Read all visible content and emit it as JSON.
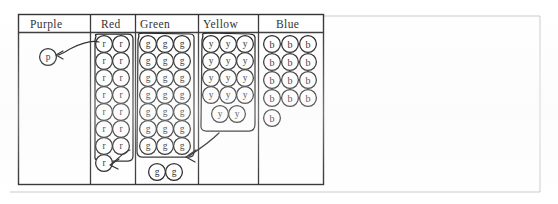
{
  "page": {
    "background_color": "#ffffff",
    "ink_color": "#111111",
    "rule_color": "#2b2b2b",
    "faint_rule_color": "#c9c9c9",
    "width": 558,
    "height": 204
  },
  "table": {
    "x": 18,
    "y": 14,
    "width": 305,
    "height": 170,
    "header_height": 18,
    "columns": [
      {
        "key": "purple",
        "label": "Purple",
        "x": 18,
        "width": 72,
        "label_x": 30,
        "label_y": 19
      },
      {
        "key": "red",
        "label": "Red",
        "x": 90,
        "width": 45,
        "label_x": 101,
        "label_y": 19
      },
      {
        "key": "green",
        "label": "Green",
        "x": 135,
        "width": 63,
        "label_x": 140,
        "label_y": 19
      },
      {
        "key": "yellow",
        "label": "Yellow",
        "x": 198,
        "width": 60,
        "label_x": 203,
        "label_y": 19
      },
      {
        "key": "blue",
        "label": "Blue",
        "x": 258,
        "width": 65,
        "label_x": 276,
        "label_y": 19
      }
    ]
  },
  "tokens": {
    "radius": 8.4,
    "columns": [
      {
        "key": "purple",
        "letter": "p",
        "count": 1,
        "grouped": false,
        "positions": [
          {
            "cx": 48,
            "cy": 57
          }
        ]
      },
      {
        "key": "red",
        "letter": "r",
        "count": 15,
        "grouped": true,
        "positions": [
          {
            "cx": 104,
            "cy": 44
          },
          {
            "cx": 121,
            "cy": 44
          },
          {
            "cx": 104,
            "cy": 61
          },
          {
            "cx": 121,
            "cy": 61
          },
          {
            "cx": 104,
            "cy": 78
          },
          {
            "cx": 121,
            "cy": 78
          },
          {
            "cx": 104,
            "cy": 95
          },
          {
            "cx": 121,
            "cy": 95
          },
          {
            "cx": 104,
            "cy": 112
          },
          {
            "cx": 121,
            "cy": 112
          },
          {
            "cx": 104,
            "cy": 129
          },
          {
            "cx": 121,
            "cy": 129
          },
          {
            "cx": 104,
            "cy": 146
          },
          {
            "cx": 121,
            "cy": 146
          },
          {
            "cx": 104,
            "cy": 163
          }
        ]
      },
      {
        "key": "green",
        "letter": "g",
        "count": 23,
        "grouped": true,
        "positions": [
          {
            "cx": 148,
            "cy": 44
          },
          {
            "cx": 165,
            "cy": 44
          },
          {
            "cx": 182,
            "cy": 44
          },
          {
            "cx": 148,
            "cy": 61
          },
          {
            "cx": 165,
            "cy": 61
          },
          {
            "cx": 182,
            "cy": 61
          },
          {
            "cx": 148,
            "cy": 78
          },
          {
            "cx": 165,
            "cy": 78
          },
          {
            "cx": 182,
            "cy": 78
          },
          {
            "cx": 148,
            "cy": 95
          },
          {
            "cx": 165,
            "cy": 95
          },
          {
            "cx": 182,
            "cy": 95
          },
          {
            "cx": 148,
            "cy": 112
          },
          {
            "cx": 165,
            "cy": 112
          },
          {
            "cx": 182,
            "cy": 112
          },
          {
            "cx": 148,
            "cy": 129
          },
          {
            "cx": 165,
            "cy": 129
          },
          {
            "cx": 182,
            "cy": 129
          },
          {
            "cx": 148,
            "cy": 146
          },
          {
            "cx": 165,
            "cy": 146
          },
          {
            "cx": 182,
            "cy": 146
          },
          {
            "cx": 157,
            "cy": 172
          },
          {
            "cx": 174,
            "cy": 172
          }
        ]
      },
      {
        "key": "yellow",
        "letter": "y",
        "count": 14,
        "grouped": true,
        "positions": [
          {
            "cx": 211,
            "cy": 44
          },
          {
            "cx": 228,
            "cy": 44
          },
          {
            "cx": 245,
            "cy": 44
          },
          {
            "cx": 211,
            "cy": 61
          },
          {
            "cx": 228,
            "cy": 61
          },
          {
            "cx": 245,
            "cy": 61
          },
          {
            "cx": 211,
            "cy": 78
          },
          {
            "cx": 228,
            "cy": 78
          },
          {
            "cx": 245,
            "cy": 78
          },
          {
            "cx": 211,
            "cy": 95
          },
          {
            "cx": 228,
            "cy": 95
          },
          {
            "cx": 245,
            "cy": 95
          },
          {
            "cx": 220,
            "cy": 114
          },
          {
            "cx": 237,
            "cy": 114
          }
        ]
      },
      {
        "key": "blue",
        "letter": "b",
        "count": 13,
        "grouped": false,
        "positions": [
          {
            "cx": 272,
            "cy": 44
          },
          {
            "cx": 290,
            "cy": 44
          },
          {
            "cx": 308,
            "cy": 44
          },
          {
            "cx": 272,
            "cy": 62
          },
          {
            "cx": 290,
            "cy": 62
          },
          {
            "cx": 308,
            "cy": 62
          },
          {
            "cx": 272,
            "cy": 80
          },
          {
            "cx": 290,
            "cy": 80
          },
          {
            "cx": 308,
            "cy": 80
          },
          {
            "cx": 272,
            "cy": 98
          },
          {
            "cx": 290,
            "cy": 98
          },
          {
            "cx": 308,
            "cy": 98
          },
          {
            "cx": 272,
            "cy": 118
          }
        ]
      }
    ]
  },
  "annotations": {
    "group_loops": [
      {
        "name": "red-group-loop",
        "path": "M96,36 Q94,34 99,34 L128,34 Q133,34 133,39 L133,156 Q133,161 128,161 L99,161 Q94,161 95,155 L95,40 Z"
      },
      {
        "name": "green-group-loop",
        "path": "M139,36 Q137,33 143,33 L190,34 Q195,34 194,40 L194,152 Q194,157 189,157 L142,157 Q137,157 137,151 L138,40 Z"
      },
      {
        "name": "yellow-group-loop",
        "path": "M203,36 Q201,33 207,33 L250,34 Q256,34 255,40 L255,124 Q255,131 249,131 L206,131 Q200,131 201,124 L202,40 Z"
      }
    ],
    "arrows": [
      {
        "name": "purple-callout-arrow",
        "path": "M99,42 C92,40 80,44 72,48 C66,51 62,54 58,55",
        "head": "M63,51 L56,55 L63,59"
      },
      {
        "name": "green-to-red-arrow",
        "path": "M130,150 C124,152 118,158 112,164",
        "head": "M119,159 L110,165 L118,169"
      },
      {
        "name": "yellow-to-green-arrow",
        "path": "M219,133 C210,142 198,150 189,156",
        "head": "M196,150 L186,157 L195,162"
      }
    ],
    "faint_rules": [
      {
        "name": "faint-rule-top",
        "x1": 323,
        "y1": 16,
        "x2": 540,
        "y2": 16
      },
      {
        "name": "faint-rule-bottom",
        "x1": 10,
        "y1": 192,
        "x2": 540,
        "y2": 192
      },
      {
        "name": "faint-rule-right",
        "x1": 540,
        "y1": 16,
        "x2": 540,
        "y2": 192
      }
    ]
  }
}
